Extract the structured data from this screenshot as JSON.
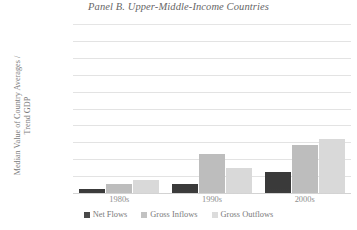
{
  "chart_data": {
    "type": "bar",
    "title": "Panel B. Upper-Middle-Income Countries",
    "xlabel": "",
    "ylabel": "Median Value of Country Averages /\nTrend GDP",
    "categories": [
      "1980s",
      "1990s",
      "2000s"
    ],
    "series": [
      {
        "name": "Net Flows",
        "values": [
          0.5,
          1.1,
          2.5
        ],
        "color": "#3a3a3a"
      },
      {
        "name": "Gross Inflows",
        "values": [
          1.1,
          4.6,
          5.7
        ],
        "color": "#bdbdbd"
      },
      {
        "name": "Gross Outflows",
        "values": [
          1.5,
          3.0,
          6.4
        ],
        "color": "#d9d9d9"
      }
    ],
    "ylim": [
      0,
      20
    ],
    "ytick_step": 2,
    "ytick_labels": [
      "20%",
      "18%",
      "16%",
      "14%",
      "12%",
      "10%",
      "8%",
      "6%",
      "4%",
      "2%",
      "0%"
    ],
    "grid": true,
    "legend_position": "bottom"
  },
  "legend": {
    "items": [
      {
        "label": "Net Flows"
      },
      {
        "label": "Gross Inflows"
      },
      {
        "label": "Gross Outflows"
      }
    ]
  }
}
